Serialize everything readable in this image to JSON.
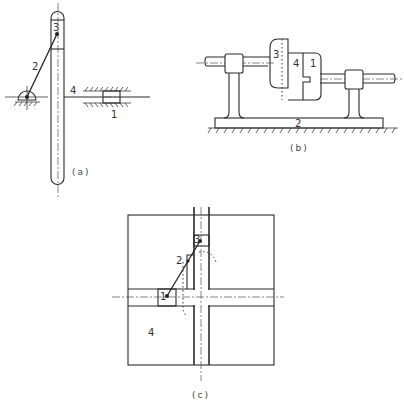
{
  "figures": [
    {
      "id": "a",
      "caption": "(a)",
      "labels": {
        "slider_in_slot": "3",
        "crank": "2",
        "rod": "4",
        "slider_block": "1"
      },
      "description": "Crank 2 pivoting on ground drives slider 3 in slotted bar 4; bar 4 connected by rod to slider 1 in fixed guide"
    },
    {
      "id": "b",
      "caption": "(b)",
      "labels": {
        "disc": "3",
        "coupling_middle": "4",
        "coupling_right": "1",
        "base": "2"
      },
      "description": "Shaft coupling mounted in two bearings on base 2 with ground hatching"
    },
    {
      "id": "c",
      "caption": "(c)",
      "labels": {
        "slider_vertical": "3",
        "link": "2",
        "slider_horizontal": "1",
        "frame": "4"
      },
      "description": "Square frame 4 with cross-shaped slots; slider 1 in horizontal slot and slider 3 in vertical slot connected by link 2"
    }
  ],
  "colors": {
    "line": "#2a2a2a",
    "background": "#ffffff"
  }
}
